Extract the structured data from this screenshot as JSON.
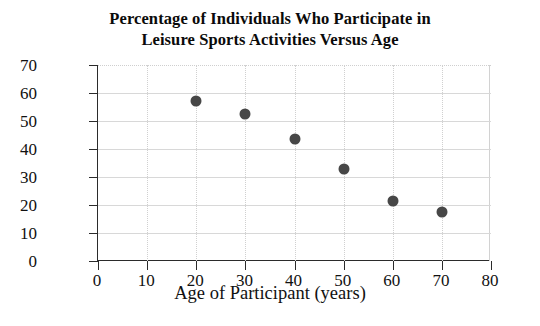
{
  "chart_data": {
    "type": "scatter",
    "title": "Percentage of Individuals Who Participate in Leisure Sports Activities Versus Age",
    "title_line1": "Percentage of Individuals Who Participate in",
    "title_line2": "Leisure Sports Activities Versus Age",
    "xlabel": "Age of Participant (years)",
    "ylabel": "Percent",
    "xlim": [
      0,
      80
    ],
    "ylim": [
      0,
      70
    ],
    "xticks": [
      0,
      10,
      20,
      30,
      40,
      50,
      60,
      70,
      80
    ],
    "yticks": [
      0,
      10,
      20,
      30,
      40,
      50,
      60,
      70
    ],
    "xtick_labels": [
      "0",
      "10",
      "20",
      "30",
      "40",
      "50",
      "60",
      "70",
      "80"
    ],
    "ytick_labels": [
      "0",
      "10",
      "20",
      "30",
      "40",
      "50",
      "60",
      "70"
    ],
    "grid": true,
    "legend": null,
    "x": [
      20,
      30,
      40,
      50,
      60,
      70
    ],
    "values": [
      57,
      52.5,
      43.5,
      33,
      21.5,
      17.5
    ],
    "points": [
      {
        "x": 20,
        "y": 57
      },
      {
        "x": 30,
        "y": 52.5
      },
      {
        "x": 40,
        "y": 43.5
      },
      {
        "x": 50,
        "y": 33
      },
      {
        "x": 60,
        "y": 21.5
      },
      {
        "x": 70,
        "y": 17.5
      }
    ],
    "marker_color": "#474747"
  }
}
